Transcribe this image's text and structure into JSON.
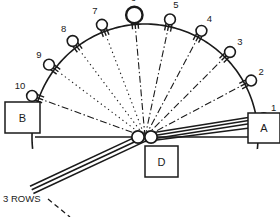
{
  "diagram": {
    "title": "3 ROWS",
    "colors": {
      "ink": "#1a1a1a",
      "background": "#ffffff"
    },
    "geometry": {
      "center_x": 145,
      "center_y": 137,
      "radius": 113,
      "baseline_y": 137,
      "baseline_x1": 35,
      "baseline_x2": 250
    },
    "hub": {
      "name": "center-hub",
      "circles": [
        {
          "cx": 138,
          "cy": 137,
          "r": 6.2
        },
        {
          "cx": 151,
          "cy": 137,
          "r": 6.2
        }
      ]
    },
    "positions": [
      {
        "id": "1",
        "angle_deg": 9,
        "label_dx": 10,
        "label_dy": -7,
        "big": false,
        "line_style": "thick-triple"
      },
      {
        "id": "2",
        "angle_deg": 28,
        "label_dx": 10,
        "label_dy": -6,
        "big": false,
        "line_style": "dash-dot"
      },
      {
        "id": "3",
        "angle_deg": 45,
        "label_dx": 10,
        "label_dy": -7,
        "big": false,
        "line_style": "dash-dot"
      },
      {
        "id": "4",
        "angle_deg": 62,
        "label_dx": 8,
        "label_dy": -9,
        "big": false,
        "line_style": "dash-dot"
      },
      {
        "id": "5",
        "angle_deg": 78,
        "label_dx": 6,
        "label_dy": -11,
        "big": false,
        "line_style": "dash-dot"
      },
      {
        "id": "6",
        "angle_deg": 95,
        "label_dx": -1,
        "label_dy": -14,
        "big": true,
        "line_style": "dash-dot"
      },
      {
        "id": "7",
        "angle_deg": 111,
        "label_dx": -7,
        "label_dy": -11,
        "big": false,
        "line_style": "dotted"
      },
      {
        "id": "8",
        "angle_deg": 127,
        "label_dx": -9,
        "label_dy": -9,
        "big": false,
        "line_style": "dotted"
      },
      {
        "id": "9",
        "angle_deg": 143,
        "label_dx": -10,
        "label_dy": -7,
        "big": false,
        "line_style": "dotted"
      },
      {
        "id": "10",
        "angle_deg": 160,
        "label_dx": -12,
        "label_dy": -7,
        "big": false,
        "line_style": "dash-dot"
      }
    ],
    "boxes": [
      {
        "name": "box-a",
        "label": "A",
        "x": 248,
        "y": 113,
        "w": 32,
        "h": 30
      },
      {
        "name": "box-b",
        "label": "B",
        "x": 5,
        "y": 102,
        "w": 35,
        "h": 31
      },
      {
        "name": "box-d",
        "label": "D",
        "x": 145,
        "y": 146,
        "w": 33,
        "h": 31
      }
    ],
    "rows_callout": {
      "label": "3 ROWS",
      "label_x": 3,
      "label_y": 202,
      "leader_from": [
        48,
        199
      ],
      "leader_to": [
        70,
        217
      ]
    },
    "lower_beam": {
      "name": "lower-triple-beam",
      "angle_deg": 205,
      "length": 125,
      "offsets": [
        -4,
        0,
        4
      ]
    }
  }
}
